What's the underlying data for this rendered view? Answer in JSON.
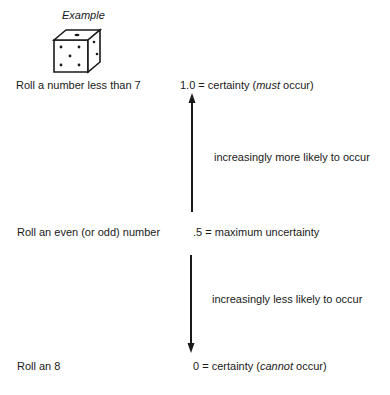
{
  "example": {
    "label": "Example",
    "die_icon": "die-icon"
  },
  "events": [
    {
      "label": "Roll a number less than 7"
    },
    {
      "label": "Roll an even (or odd) number"
    },
    {
      "label": "Roll an 8"
    }
  ],
  "scale": {
    "top": {
      "value": "1.0",
      "eq": "=",
      "desc_pre": "certainty (",
      "desc_em": "must",
      "desc_post": " occur)"
    },
    "middle": {
      "value": ".5",
      "eq": "=",
      "desc": "maximum uncertainty"
    },
    "bottom": {
      "value": "0",
      "eq": "=",
      "desc_pre": "certainty (",
      "desc_em": "cannot",
      "desc_post": " occur)"
    }
  },
  "arrows": {
    "up_label": "increasingly more likely to occur",
    "down_label": "increasingly less likely to occur",
    "up_icon": "arrow-up-icon",
    "down_icon": "arrow-down-icon"
  },
  "colors": {
    "ink": "#1a1a1a",
    "background": "#ffffff"
  }
}
